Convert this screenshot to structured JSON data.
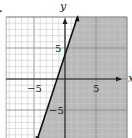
{
  "problem_marker": ".",
  "chart_data": {
    "type": "line",
    "title": "",
    "xlabel": "x",
    "ylabel": "y",
    "xlim": [
      -9.5,
      10
    ],
    "ylim": [
      -9.5,
      10
    ],
    "grid": true,
    "grid_minor_step": 1,
    "grid_major_step": 5,
    "x_ticks_labeled": [
      -5,
      5
    ],
    "y_ticks_labeled": [
      5,
      -5
    ],
    "tick_labels": {
      "x_neg": "−5",
      "x_pos": "5",
      "y_pos": "5",
      "y_neg": "−5"
    },
    "series": [
      {
        "name": "boundary line y = 3x + 4",
        "style": "solid",
        "points": [
          [
            -4.5,
            -9.5
          ],
          [
            -1.333,
            0
          ],
          [
            0,
            4
          ],
          [
            2,
            10
          ]
        ]
      }
    ],
    "shaded_region": {
      "description": "half-plane to the right of / below the line",
      "inequality": "y ≤ 3x + 4",
      "color": "#b9b9b9"
    },
    "colors": {
      "shade": "#b9b9b9",
      "grid_minor": "#c8c8c8",
      "grid_major": "#8c8c8c",
      "axis": "#222222",
      "line": "#111111"
    }
  }
}
